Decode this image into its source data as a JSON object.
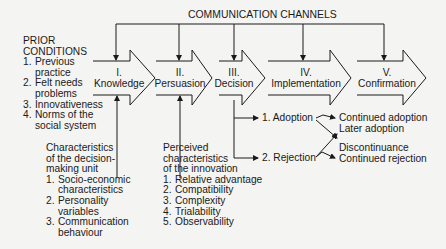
{
  "title": "COMMUNICATION CHANNELS",
  "prior_conditions": {
    "heading": [
      "PRIOR",
      "CONDITIONS"
    ],
    "items": [
      {
        "n": "1.",
        "lines": [
          "Previous",
          "practice"
        ]
      },
      {
        "n": "2.",
        "lines": [
          "Felt needs",
          "problems"
        ]
      },
      {
        "n": "3.",
        "lines": [
          "Innovativeness"
        ]
      },
      {
        "n": "4.",
        "lines": [
          "Norms of the",
          "social system"
        ]
      }
    ]
  },
  "stages": [
    {
      "numeral": "I.",
      "label": "Knowledge"
    },
    {
      "numeral": "II.",
      "label": "Persuasion"
    },
    {
      "numeral": "III.",
      "label": "Decision"
    },
    {
      "numeral": "IV.",
      "label": "Implementation"
    },
    {
      "numeral": "V.",
      "label": "Confirmation"
    }
  ],
  "decision_unit": {
    "heading": [
      "Characteristics",
      "of the decision-",
      "making unit"
    ],
    "items": [
      {
        "n": "1.",
        "lines": [
          "Socio-economic",
          "characteristics"
        ]
      },
      {
        "n": "2.",
        "lines": [
          "Personality",
          "variables"
        ]
      },
      {
        "n": "3.",
        "lines": [
          "Communication",
          "behaviour"
        ]
      }
    ]
  },
  "innovation": {
    "heading": [
      "Perceived",
      "characteristics",
      "of the innovation"
    ],
    "items": [
      {
        "n": "1.",
        "lines": [
          "Relative advantage"
        ]
      },
      {
        "n": "2.",
        "lines": [
          "Compatibility"
        ]
      },
      {
        "n": "3.",
        "lines": [
          "Complexity"
        ]
      },
      {
        "n": "4.",
        "lines": [
          "Trialability"
        ]
      },
      {
        "n": "5.",
        "lines": [
          "Observability"
        ]
      }
    ]
  },
  "outcomes": {
    "adoption": "1. Adoption",
    "rejection": "2. Rejection",
    "continued_adoption": "Continued adoption",
    "later_adoption": "Later adoption",
    "discontinuance": "Discontinuance",
    "continued_rejection": "Continued rejection"
  }
}
